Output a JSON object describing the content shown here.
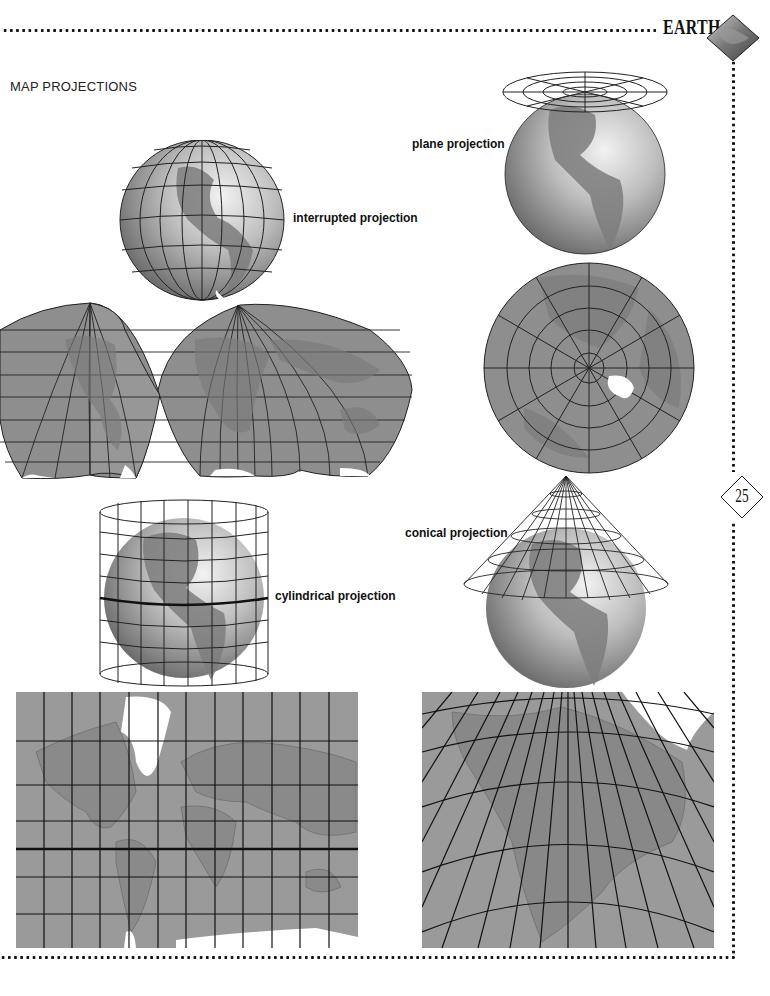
{
  "header": {
    "title": "EARTH",
    "emblem": "diamond-globe-emblem"
  },
  "section": {
    "title": "MAP PROJECTIONS"
  },
  "page": {
    "number": "25"
  },
  "figures": [
    {
      "id": "interrupted",
      "label": "interrupted projection",
      "globe": "globe-with-peeled-gores",
      "map": "interrupted-homolosine-world-map"
    },
    {
      "id": "plane",
      "label": "plane projection",
      "globe": "globe-with-tangent-plane",
      "map": "azimuthal-polar-map"
    },
    {
      "id": "cylindrical",
      "label": "cylindrical projection",
      "globe": "globe-inside-cylinder",
      "map": "mercator-world-map"
    },
    {
      "id": "conical",
      "label": "conical projection",
      "globe": "globe-with-cone",
      "map": "conic-north-america-map"
    }
  ],
  "colors": {
    "ink": "#111111",
    "land": "#8c8c8c",
    "ocean": "#9a9a9a",
    "globe_light": "#d8d8d8",
    "globe_dark": "#6e6e6e",
    "ice": "#ffffff"
  }
}
